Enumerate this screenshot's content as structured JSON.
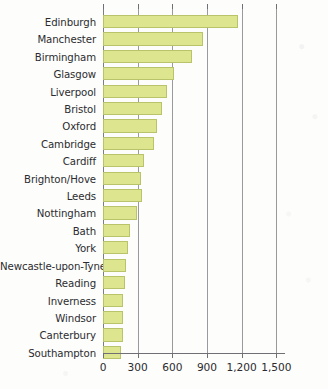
{
  "chart_data": {
    "type": "bar",
    "orientation": "horizontal",
    "title": "",
    "subtitle": "",
    "xlabel": "",
    "ylabel": "",
    "xlim": [
      0,
      1575
    ],
    "xticks": [
      0,
      300,
      600,
      900,
      1200,
      1500
    ],
    "xtick_labels": [
      "0",
      "300",
      "600",
      "900",
      "1,200",
      "1,500"
    ],
    "grid": true,
    "grid_axis": "x",
    "legend": null,
    "bar_fill_color": "#dde58f",
    "bar_edge_color": "#b9c46a",
    "axis_color": "#6f6f74",
    "text_color": "#2c2c30",
    "background_color": "#fdfdfb",
    "categories": [
      "Edinburgh",
      "Manchester",
      "Birmingham",
      "Glasgow",
      "Liverpool",
      "Bristol",
      "Oxford",
      "Cambridge",
      "Cardiff",
      "Brighton/Hove",
      "Leeds",
      "Nottingham",
      "Bath",
      "York",
      "Newcastle-upon-Tyne",
      "Reading",
      "Inverness",
      "Windsor",
      "Canterbury",
      "Southampton"
    ],
    "values": [
      1170,
      865,
      770,
      615,
      555,
      510,
      465,
      440,
      355,
      330,
      335,
      295,
      235,
      215,
      200,
      190,
      175,
      175,
      172,
      155
    ]
  }
}
